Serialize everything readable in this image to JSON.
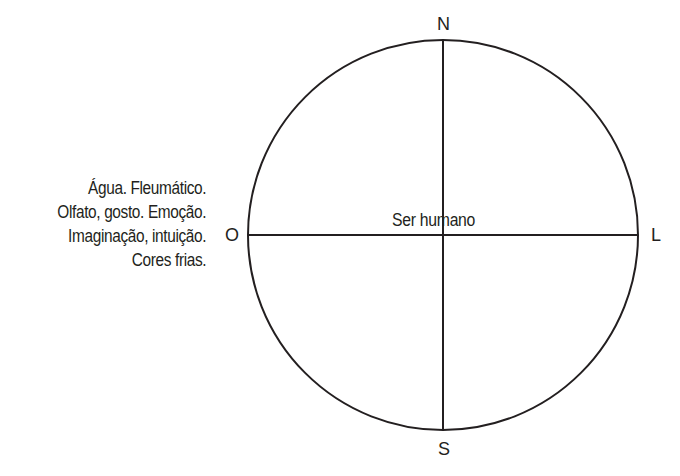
{
  "diagram": {
    "center_label": "Ser humano",
    "directions": {
      "north": "N",
      "south": "S",
      "east": "L",
      "west": "O"
    },
    "west_description": [
      "Água. Fleumático.",
      "Olfato, gosto. Emoção.",
      "Imaginação, intuição.",
      "Cores frias."
    ],
    "stroke_color": "#231f20",
    "background_color": "#ffffff"
  }
}
